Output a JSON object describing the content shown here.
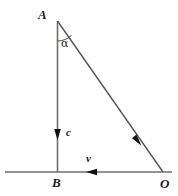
{
  "figure": {
    "type": "geometry-diagram",
    "canvas": {
      "width": 178,
      "height": 196,
      "background": "#ffffff"
    },
    "colors": {
      "line": "#6f6f6f",
      "hypotenuse": "#555555",
      "arrow": "#111111",
      "text": "#1a1a1a"
    },
    "vertices": [
      {
        "id": "A",
        "label": "A",
        "x": 57,
        "y": 21
      },
      {
        "id": "B",
        "label": "B",
        "x": 57,
        "y": 172
      },
      {
        "id": "O",
        "label": "O",
        "x": 163,
        "y": 172
      }
    ],
    "segments": [
      {
        "id": "AB",
        "from": "A",
        "to": "B",
        "x1": 57,
        "y1": 21,
        "x2": 57,
        "y2": 172
      },
      {
        "id": "AO",
        "from": "A",
        "to": "O",
        "x1": 57,
        "y1": 21,
        "x2": 163,
        "y2": 172
      },
      {
        "id": "baseline",
        "from": "left-edge",
        "to": "right-edge",
        "x1": 5,
        "y1": 172,
        "x2": 172,
        "y2": 172
      }
    ],
    "vectors": [
      {
        "id": "c",
        "label": "c",
        "on": "AB",
        "direction": "down",
        "tip_x": 57,
        "tip_y": 139
      },
      {
        "id": "v",
        "label": "v",
        "on": "baseline",
        "direction": "left",
        "tip_x": 86,
        "tip_y": 172
      },
      {
        "id": "resultant",
        "label": "",
        "on": "AO",
        "direction": "down-right",
        "tip_x": 141,
        "tip_y": 145
      }
    ],
    "angles": [
      {
        "id": "alpha",
        "label": "α",
        "at": "A",
        "between": [
          "AB",
          "AO"
        ],
        "radius": 18
      }
    ]
  }
}
